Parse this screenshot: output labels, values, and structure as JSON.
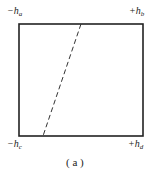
{
  "figure": {
    "caption": "( a )",
    "rectangle": {
      "x": 19,
      "y": 24,
      "width": 124,
      "height": 112,
      "stroke": "#222222"
    },
    "dashed_line": {
      "x1": 81,
      "y1": 24,
      "x2": 43,
      "y2": 136,
      "stroke": "#333333"
    },
    "corners": [
      {
        "id": "top-left",
        "sign": "−",
        "var": "h",
        "sub": "a"
      },
      {
        "id": "top-right",
        "sign": "+",
        "var": "h",
        "sub": "b"
      },
      {
        "id": "bottom-left",
        "sign": "−",
        "var": "h",
        "sub": "c"
      },
      {
        "id": "bottom-right",
        "sign": "+",
        "var": "h",
        "sub": "d"
      }
    ]
  }
}
